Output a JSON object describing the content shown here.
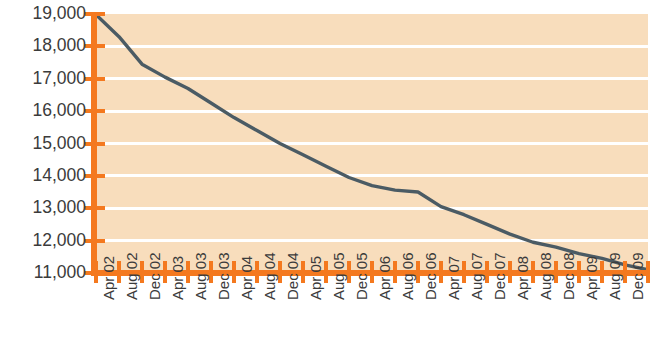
{
  "chart_data": {
    "type": "line",
    "title": "",
    "subtitle": "",
    "xlabel": "",
    "ylabel": "",
    "grid": true,
    "legend": "none",
    "ylim": [
      11000,
      19000
    ],
    "ytick_step": 1000,
    "ytick_labels": [
      "19,000",
      "18,000",
      "17,000",
      "16,000",
      "15,000",
      "14,000",
      "13,000",
      "12,000",
      "11,000"
    ],
    "ytick_values": [
      19000,
      18000,
      17000,
      16000,
      15000,
      14000,
      13000,
      12000,
      11000
    ],
    "categories": [
      "Apr 02",
      "Aug 02",
      "Dec 02",
      "Apr 03",
      "Aug 03",
      "Dec 03",
      "Apr 04",
      "Aug 04",
      "Dec 04",
      "Apr 05",
      "Aug 05",
      "Dec 05",
      "Apr 06",
      "Aug 06",
      "Dec 06",
      "Apr 07",
      "Aug 07",
      "Dec 07",
      "Apr 08",
      "Aug 08",
      "Dec 08",
      "Apr 09",
      "Aug 09",
      "Dec 09",
      "Apr 10"
    ],
    "values": [
      18980,
      18300,
      17450,
      17050,
      16700,
      16250,
      15800,
      15400,
      15000,
      14650,
      14300,
      13950,
      13700,
      13560,
      13500,
      13050,
      12800,
      12500,
      12200,
      11950,
      11800,
      11600,
      11450,
      11250,
      11100
    ],
    "series": [
      {
        "name": "series-1",
        "color": "#4b5b64",
        "values": [
          18980,
          18300,
          17450,
          17050,
          16700,
          16250,
          15800,
          15400,
          15000,
          14650,
          14300,
          13950,
          13700,
          13560,
          13500,
          13050,
          12800,
          12500,
          12200,
          11950,
          11800,
          11600,
          11450,
          11250,
          11100
        ]
      }
    ]
  },
  "style": {
    "plot_background": "#f8ddbc",
    "gridline_color": "#ffffff",
    "axis_color": "#f4791f",
    "line_color": "#4b5b64",
    "label_color": "#3b3b3b",
    "page_background": "#ffffff"
  }
}
